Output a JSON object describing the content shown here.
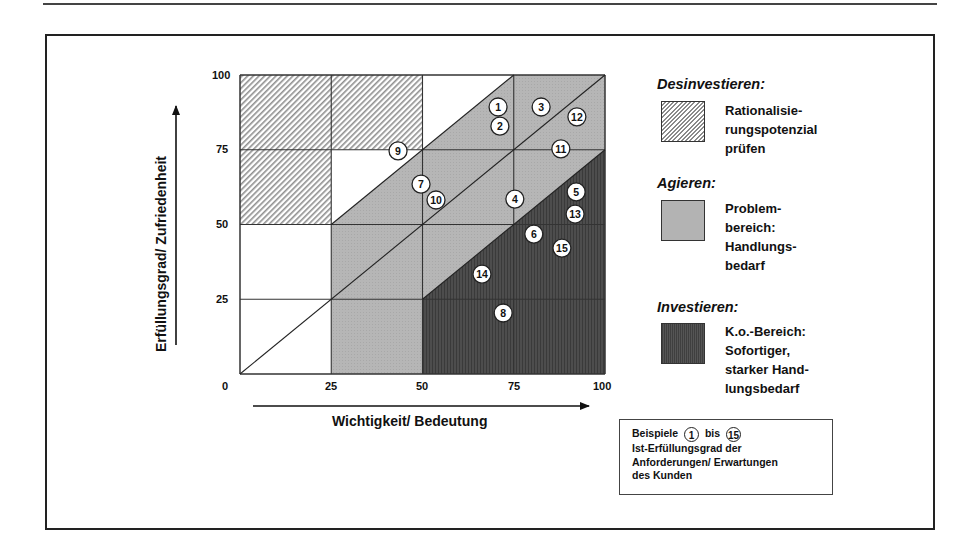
{
  "figure": {
    "y_axis_label": "Erfüllungsgrad/ Zufriedenheit",
    "x_axis_label": "Wichtigkeit/ Bedeutung",
    "y_ticks": [
      "100",
      "75",
      "50",
      "25"
    ],
    "x_ticks": [
      "0",
      "25",
      "50",
      "75",
      "100"
    ]
  },
  "legend": {
    "items": [
      {
        "title": "Desinvestieren:",
        "lines": [
          "Rationalisie-",
          "rungspotenzial",
          "prüfen"
        ],
        "pattern": "hatched"
      },
      {
        "title": "Agieren:",
        "lines": [
          "Problem-",
          "bereich:",
          "Handlungs-",
          "bedarf"
        ],
        "pattern": "light-grey",
        "color": "#b3b3b3"
      },
      {
        "title": "Investieren:",
        "lines": [
          "K.o.-Bereich:",
          "Sofortiger,",
          "starker Hand-",
          "lungsbedarf"
        ],
        "pattern": "dark-grey",
        "color": "#4a4a4a"
      }
    ]
  },
  "note": {
    "prefix": "Beispiele",
    "from": "1",
    "middle": "bis",
    "to": "15",
    "lines": [
      "Ist-Erfüllungsgrad der",
      "Anforderungen/ Erwartungen",
      "des Kunden"
    ]
  },
  "chart_data": {
    "type": "scatter",
    "title": "",
    "xlabel": "Wichtigkeit/ Bedeutung",
    "ylabel": "Erfüllungsgrad/ Zufriedenheit",
    "xlim": [
      0,
      100
    ],
    "ylim": [
      0,
      100
    ],
    "grid": true,
    "x_ticks": [
      0,
      25,
      50,
      75,
      100
    ],
    "y_ticks": [
      0,
      25,
      50,
      75,
      100
    ],
    "regions": [
      {
        "name": "Desinvestieren",
        "fill": "hatched",
        "polygons": [
          [
            [
              0,
              50
            ],
            [
              25,
              50
            ],
            [
              25,
              75
            ],
            [
              50,
              75
            ],
            [
              50,
              100
            ],
            [
              0,
              100
            ]
          ]
        ]
      },
      {
        "name": "neutral",
        "fill": "#ffffff",
        "polygons": [
          [
            [
              0,
              0
            ],
            [
              25,
              0
            ],
            [
              25,
              50
            ],
            [
              0,
              50
            ]
          ],
          [
            [
              25,
              50
            ],
            [
              50,
              75
            ],
            [
              25,
              75
            ]
          ],
          [
            [
              50,
              75
            ],
            [
              75,
              100
            ],
            [
              50,
              100
            ]
          ]
        ]
      },
      {
        "name": "Agieren",
        "fill": "#b3b3b3",
        "polygons": [
          [
            [
              25,
              0
            ],
            [
              50,
              0
            ],
            [
              50,
              25
            ],
            [
              100,
              75
            ],
            [
              100,
              100
            ],
            [
              75,
              100
            ],
            [
              25,
              50
            ]
          ]
        ]
      },
      {
        "name": "Investieren",
        "fill": "#4a4a4a",
        "polygons": [
          [
            [
              50,
              0
            ],
            [
              100,
              0
            ],
            [
              100,
              75
            ],
            [
              50,
              25
            ]
          ]
        ]
      }
    ],
    "lines": [
      {
        "from": [
          0,
          0
        ],
        "to": [
          100,
          100
        ]
      },
      {
        "from": [
          25,
          50
        ],
        "to": [
          75,
          100
        ]
      },
      {
        "from": [
          50,
          25
        ],
        "to": [
          100,
          75
        ]
      }
    ],
    "points": [
      {
        "label": "1",
        "x": 70.7,
        "y": 89.3
      },
      {
        "label": "2",
        "x": 71.2,
        "y": 82.9
      },
      {
        "label": "3",
        "x": 82.5,
        "y": 89.3
      },
      {
        "label": "4",
        "x": 75.3,
        "y": 58.5
      },
      {
        "label": "5",
        "x": 92.1,
        "y": 60.9
      },
      {
        "label": "6",
        "x": 80.5,
        "y": 46.8
      },
      {
        "label": "7",
        "x": 49.6,
        "y": 63.5
      },
      {
        "label": "8",
        "x": 72.1,
        "y": 20.4
      },
      {
        "label": "9",
        "x": 43.3,
        "y": 74.6
      },
      {
        "label": "10",
        "x": 53.7,
        "y": 58.2
      },
      {
        "label": "11",
        "x": 87.9,
        "y": 75.3
      },
      {
        "label": "12",
        "x": 92.3,
        "y": 86.0
      },
      {
        "label": "13",
        "x": 91.8,
        "y": 53.5
      },
      {
        "label": "14",
        "x": 66.3,
        "y": 33.4
      },
      {
        "label": "15",
        "x": 88.2,
        "y": 42.1
      }
    ]
  }
}
